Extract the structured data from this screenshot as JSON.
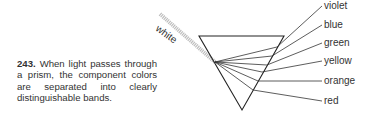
{
  "figure": {
    "number": "243.",
    "caption": "When light passes through a prism, the component colors are separated into clearly distinguishable bands."
  },
  "diagram": {
    "input_label": "white",
    "bands": [
      "violet",
      "blue",
      "green",
      "yellow",
      "orange",
      "red"
    ]
  }
}
